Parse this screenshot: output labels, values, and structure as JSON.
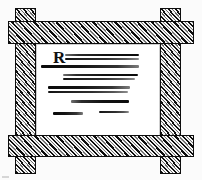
{
  "illustration": {
    "title": "Framed notice board sketch",
    "style": "hand-drawn woodcut line art",
    "background_color": "#fbfbfb",
    "ink_color": "#111111",
    "panel_color": "#ffffff"
  },
  "frame": {
    "material_label": "hatched timber",
    "stroke_color": "#0d0d0d",
    "fill_color": "#b9b9b9",
    "members": [
      {
        "name": "post-left",
        "orientation": "vertical"
      },
      {
        "name": "post-right",
        "orientation": "vertical"
      },
      {
        "name": "rail-top",
        "orientation": "horizontal"
      },
      {
        "name": "rail-bottom",
        "orientation": "horizontal"
      }
    ]
  },
  "notice": {
    "drop_cap": "R",
    "text_lines": [
      {
        "id": 1,
        "left": 29,
        "top": 10,
        "width": 74,
        "height": 2.4,
        "shade": "rev"
      },
      {
        "id": 2,
        "left": 29,
        "top": 14,
        "width": 74,
        "height": 1.8,
        "shade": "plain"
      },
      {
        "id": 3,
        "left": 5,
        "top": 21,
        "width": 98,
        "height": 2.6,
        "shade": "dark"
      },
      {
        "id": 4,
        "left": 27,
        "top": 30,
        "width": 75,
        "height": 2.4,
        "shade": "rev"
      },
      {
        "id": 5,
        "left": 27,
        "top": 34,
        "width": 72,
        "height": 1.6,
        "shade": "plain"
      },
      {
        "id": 6,
        "left": 12,
        "top": 42,
        "width": 82,
        "height": 3.0,
        "shade": "dark"
      },
      {
        "id": 7,
        "left": 12,
        "top": 47,
        "width": 80,
        "height": 1.8,
        "shade": "plain"
      },
      {
        "id": 8,
        "left": 35,
        "top": 56,
        "width": 58,
        "height": 2.8,
        "shade": "rev"
      },
      {
        "id": 9,
        "left": 17,
        "top": 68,
        "width": 30,
        "height": 2.6,
        "shade": "dark"
      },
      {
        "id": 10,
        "left": 63,
        "top": 67,
        "width": 30,
        "height": 2.2,
        "shade": "plain"
      }
    ]
  }
}
